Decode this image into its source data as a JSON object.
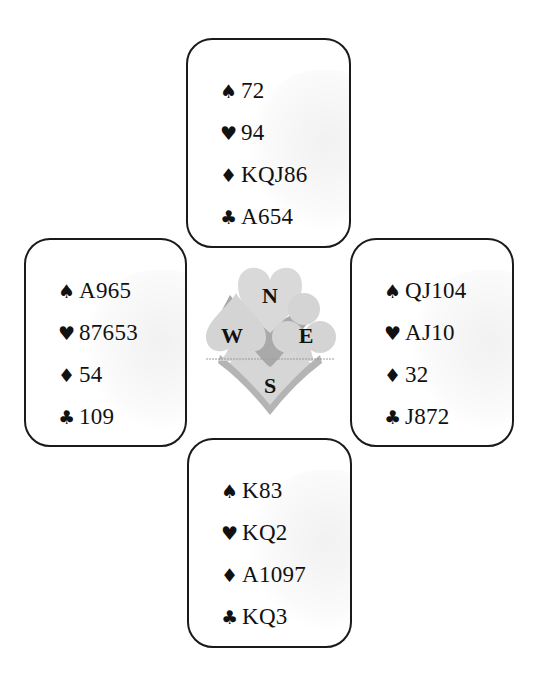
{
  "diagram": {
    "type": "bridge-deal",
    "suits": [
      {
        "name": "spades",
        "symbol": "♠"
      },
      {
        "name": "hearts",
        "symbol": "♥"
      },
      {
        "name": "diamonds",
        "symbol": "♦"
      },
      {
        "name": "clubs",
        "symbol": "♣"
      }
    ],
    "hands": {
      "north": {
        "spades": "72",
        "hearts": "94",
        "diamonds": "KQJ86",
        "clubs": "A654"
      },
      "west": {
        "spades": "A965",
        "hearts": "87653",
        "diamonds": "54",
        "clubs": "109"
      },
      "east": {
        "spades": "QJ104",
        "hearts": "AJ10",
        "diamonds": "32",
        "clubs": "J872"
      },
      "south": {
        "spades": "K83",
        "hearts": "KQ2",
        "diamonds": "A1097",
        "clubs": "KQ3"
      }
    },
    "compass": {
      "north": "N",
      "west": "W",
      "east": "E",
      "south": "S"
    },
    "colors": {
      "border": "#1a1a1a",
      "compass_fill": "#d8d8d8",
      "compass_shade": "#a8a8a8",
      "text": "#111111"
    }
  }
}
